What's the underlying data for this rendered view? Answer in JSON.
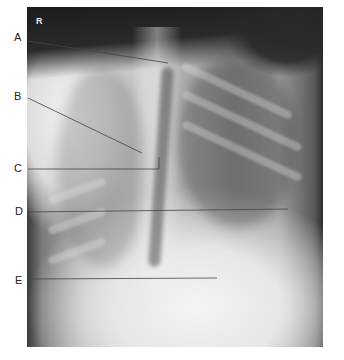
{
  "image": {
    "description": "Lateral chest X-ray radiograph with labeled anatomical pointers",
    "orientation_marker": "R"
  },
  "labels": [
    {
      "letter": "A",
      "x": 14,
      "y": 38
    },
    {
      "letter": "B",
      "x": 14,
      "y": 97
    },
    {
      "letter": "C",
      "x": 14,
      "y": 169
    },
    {
      "letter": "D",
      "x": 15,
      "y": 211
    },
    {
      "letter": "E",
      "x": 15,
      "y": 281
    }
  ],
  "colors": {
    "label_text": "#222222",
    "leader_line": "#444444",
    "background": "#ffffff"
  }
}
